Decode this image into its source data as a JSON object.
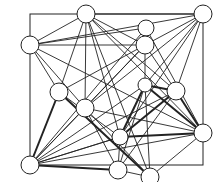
{
  "diagram": {
    "type": "graph",
    "colors": {
      "background": "#ffffff",
      "stroke": "#222222",
      "node_fill": "#ffffff"
    },
    "frame": {
      "x": 30,
      "y": 14,
      "width": 173,
      "height": 151
    },
    "nodes": [
      {
        "id": "A",
        "x": 86,
        "y": 14,
        "r": 9
      },
      {
        "id": "B",
        "x": 146,
        "y": 28,
        "r": 8
      },
      {
        "id": "C",
        "x": 203,
        "y": 14,
        "r": 9
      },
      {
        "id": "D",
        "x": 30,
        "y": 45,
        "r": 9
      },
      {
        "id": "E",
        "x": 145,
        "y": 45,
        "r": 9
      },
      {
        "id": "F",
        "x": 59,
        "y": 92,
        "r": 9
      },
      {
        "id": "G",
        "x": 85,
        "y": 108,
        "r": 9
      },
      {
        "id": "H",
        "x": 145,
        "y": 85,
        "r": 7
      },
      {
        "id": "I",
        "x": 176,
        "y": 91,
        "r": 9
      },
      {
        "id": "J",
        "x": 120,
        "y": 137,
        "r": 8
      },
      {
        "id": "K",
        "x": 203,
        "y": 133,
        "r": 9
      },
      {
        "id": "L",
        "x": 30,
        "y": 165,
        "r": 9
      },
      {
        "id": "M",
        "x": 118,
        "y": 170,
        "r": 9
      },
      {
        "id": "N",
        "x": 150,
        "y": 177,
        "r": 9
      }
    ],
    "edges": [
      {
        "from": "A",
        "to": "C",
        "w": 1
      },
      {
        "from": "A",
        "to": "D",
        "w": 1
      },
      {
        "from": "A",
        "to": "E",
        "w": 1
      },
      {
        "from": "A",
        "to": "F",
        "w": 1
      },
      {
        "from": "A",
        "to": "G",
        "w": 1
      },
      {
        "from": "A",
        "to": "I",
        "w": 1
      },
      {
        "from": "A",
        "to": "J",
        "w": 1
      },
      {
        "from": "A",
        "to": "K",
        "w": 1
      },
      {
        "from": "C",
        "to": "D",
        "w": 1
      },
      {
        "from": "C",
        "to": "E",
        "w": 1
      },
      {
        "from": "C",
        "to": "G",
        "w": 1
      },
      {
        "from": "C",
        "to": "J",
        "w": 1
      },
      {
        "from": "C",
        "to": "I",
        "w": 1
      },
      {
        "from": "C",
        "to": "H",
        "w": 1
      },
      {
        "from": "D",
        "to": "E",
        "w": 1
      },
      {
        "from": "D",
        "to": "F",
        "w": 1
      },
      {
        "from": "D",
        "to": "G",
        "w": 1
      },
      {
        "from": "D",
        "to": "K",
        "w": 1
      },
      {
        "from": "D",
        "to": "B",
        "w": 1
      },
      {
        "from": "E",
        "to": "F",
        "w": 1
      },
      {
        "from": "E",
        "to": "G",
        "w": 1
      },
      {
        "from": "E",
        "to": "I",
        "w": 1
      },
      {
        "from": "E",
        "to": "H",
        "w": 1
      },
      {
        "from": "E",
        "to": "L",
        "w": 1
      },
      {
        "from": "F",
        "to": "L",
        "w": 2
      },
      {
        "from": "F",
        "to": "N",
        "w": 2
      },
      {
        "from": "F",
        "to": "J",
        "w": 1
      },
      {
        "from": "G",
        "to": "L",
        "w": 1
      },
      {
        "from": "G",
        "to": "K",
        "w": 1
      },
      {
        "from": "G",
        "to": "N",
        "w": 1
      },
      {
        "from": "G",
        "to": "M",
        "w": 1
      },
      {
        "from": "H",
        "to": "I",
        "w": 2
      },
      {
        "from": "H",
        "to": "J",
        "w": 2
      },
      {
        "from": "H",
        "to": "L",
        "w": 1
      },
      {
        "from": "H",
        "to": "M",
        "w": 1
      },
      {
        "from": "H",
        "to": "N",
        "w": 1
      },
      {
        "from": "H",
        "to": "K",
        "w": 2
      },
      {
        "from": "I",
        "to": "J",
        "w": 2
      },
      {
        "from": "I",
        "to": "K",
        "w": 2
      },
      {
        "from": "I",
        "to": "M",
        "w": 1
      },
      {
        "from": "I",
        "to": "L",
        "w": 1
      },
      {
        "from": "J",
        "to": "K",
        "w": 2
      },
      {
        "from": "J",
        "to": "L",
        "w": 1
      },
      {
        "from": "J",
        "to": "M",
        "w": 1
      },
      {
        "from": "K",
        "to": "N",
        "w": 1
      },
      {
        "from": "K",
        "to": "L",
        "w": 1
      },
      {
        "from": "L",
        "to": "M",
        "w": 2
      },
      {
        "from": "L",
        "to": "J",
        "w": 1
      },
      {
        "from": "M",
        "to": "N",
        "w": 1
      },
      {
        "from": "B",
        "to": "K",
        "w": 1
      },
      {
        "from": "B",
        "to": "L",
        "w": 1
      },
      {
        "from": "A",
        "to": "N",
        "w": 1
      }
    ]
  }
}
